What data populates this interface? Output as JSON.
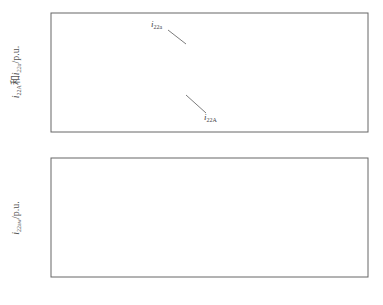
{
  "figure": {
    "caption": "图 3  区内故障时 A 相故障    的和电流 A 相差流    的仿真结果"
  },
  "chart_data": [
    {
      "type": "line",
      "title": "",
      "xlabel": "t/s",
      "ylabel": "i22A 和 i22a/p.u.",
      "xlim": [
        0,
        0.4
      ],
      "ylim": [
        -2.7,
        1.6
      ],
      "xticks": [
        "0",
        "0.1",
        "0.2",
        "0.3",
        "0.4"
      ],
      "yticks": [
        "1.6",
        "0",
        "-1.6"
      ],
      "grid": false,
      "legend": "none",
      "annotations": [
        {
          "text": "i22a",
          "x": 0.165,
          "y": 1.35
        },
        {
          "text": "i22A",
          "x": 0.19,
          "y": -1.65
        }
      ],
      "description": "Steady oscillation of amplitude ~0.25 p.u. before fault at t=0.1s; after the fault, large sinusoid with first trough about -2.2 p.u., settling to roughly ±1.2 p.u. Dotted i22a coincides with solid i22A except near t≈0.17s.",
      "series": [
        {
          "name": "i22A",
          "style": "solid",
          "x": [
            0.0,
            0.01,
            0.02,
            0.03,
            0.04,
            0.05,
            0.06,
            0.07,
            0.08,
            0.09,
            0.1,
            0.112,
            0.124,
            0.136,
            0.148,
            0.16,
            0.172,
            0.184,
            0.196,
            0.208,
            0.22,
            0.232,
            0.244,
            0.256,
            0.268,
            0.28,
            0.292,
            0.304,
            0.316,
            0.328,
            0.34,
            0.352,
            0.364,
            0.376,
            0.388,
            0.4
          ],
          "values": [
            0.2,
            -0.25,
            0.25,
            -0.25,
            0.25,
            -0.25,
            0.25,
            -0.25,
            0.25,
            -0.25,
            0.2,
            -2.2,
            0.6,
            -2.0,
            0.85,
            -1.8,
            0.9,
            -1.6,
            1.0,
            -1.5,
            1.05,
            -1.4,
            1.1,
            -1.35,
            1.15,
            -1.3,
            1.2,
            -1.25,
            1.2,
            -1.25,
            1.2,
            -1.25,
            1.2,
            -1.25,
            1.2,
            1.0
          ]
        },
        {
          "name": "i22a",
          "style": "dotted",
          "description": "Overlaps i22A; visibly separate near the fault transition around t≈0.165–0.175s."
        }
      ]
    },
    {
      "type": "line",
      "title": "",
      "xlabel": "t/s",
      "ylabel": "i22aw/p.u.",
      "xlim": [
        0,
        0.4
      ],
      "ylim": [
        -1.28,
        0
      ],
      "xticks": [
        "0",
        "0.1",
        "0.2",
        "0.3",
        "0.4"
      ],
      "yticks": [
        "0",
        "-0.64",
        "-1.28"
      ],
      "grid": false,
      "legend": "none",
      "description": "Zero until ~0.13s, small dip at ~0.137s, then periodic negative spikes decaying in magnitude.",
      "series": [
        {
          "name": "i22aw",
          "style": "solid",
          "spikes_t": [
            0.137,
            0.158,
            0.178,
            0.198,
            0.218,
            0.238,
            0.258,
            0.278,
            0.298,
            0.318,
            0.338,
            0.358,
            0.378,
            0.396
          ],
          "spikes_value": [
            -0.08,
            -1.08,
            -0.98,
            -0.86,
            -0.74,
            -0.62,
            -0.5,
            -0.4,
            -0.32,
            -0.25,
            -0.2,
            -0.17,
            -0.13,
            -0.1
          ]
        }
      ]
    }
  ]
}
